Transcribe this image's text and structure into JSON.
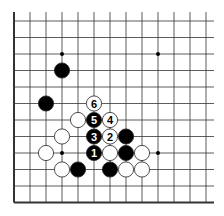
{
  "diagram": {
    "type": "go-board-fragment",
    "colors": {
      "background": "#ffffff",
      "line": "#333333",
      "black_stone": "#000000",
      "white_stone": "#ffffff",
      "stone_outline": "#222222"
    },
    "grid": {
      "x0": 14,
      "dx": 16,
      "cols": 13,
      "y0": 21,
      "dy": 16.5,
      "rows": 12,
      "top_extend": 9,
      "right_extend": 8,
      "thick_edges": [
        "left",
        "bottom"
      ]
    },
    "star_points": [
      [
        3,
        2
      ],
      [
        9,
        2
      ],
      [
        3,
        8
      ],
      [
        9,
        8
      ]
    ],
    "stones": [
      {
        "color": "black",
        "col": 3,
        "row": 3,
        "label": ""
      },
      {
        "color": "black",
        "col": 2,
        "row": 5,
        "label": ""
      },
      {
        "color": "white",
        "col": 5,
        "row": 5,
        "label": "6"
      },
      {
        "color": "white",
        "col": 4,
        "row": 6,
        "label": ""
      },
      {
        "color": "black",
        "col": 5,
        "row": 6,
        "label": "5"
      },
      {
        "color": "white",
        "col": 6,
        "row": 6,
        "label": "4"
      },
      {
        "color": "white",
        "col": 3,
        "row": 7,
        "label": ""
      },
      {
        "color": "black",
        "col": 5,
        "row": 7,
        "label": "3"
      },
      {
        "color": "white",
        "col": 6,
        "row": 7,
        "label": "2"
      },
      {
        "color": "black",
        "col": 7,
        "row": 7,
        "label": ""
      },
      {
        "color": "white",
        "col": 2,
        "row": 8,
        "label": ""
      },
      {
        "color": "black",
        "col": 5,
        "row": 8,
        "label": "1"
      },
      {
        "color": "white",
        "col": 6,
        "row": 8,
        "label": ""
      },
      {
        "color": "black",
        "col": 7,
        "row": 8,
        "label": ""
      },
      {
        "color": "white",
        "col": 8,
        "row": 8,
        "label": ""
      },
      {
        "color": "white",
        "col": 3,
        "row": 9,
        "label": ""
      },
      {
        "color": "black",
        "col": 4,
        "row": 9,
        "label": ""
      },
      {
        "color": "black",
        "col": 6,
        "row": 9,
        "label": ""
      },
      {
        "color": "white",
        "col": 7,
        "row": 9,
        "label": ""
      },
      {
        "color": "white",
        "col": 8,
        "row": 9,
        "label": ""
      }
    ]
  }
}
